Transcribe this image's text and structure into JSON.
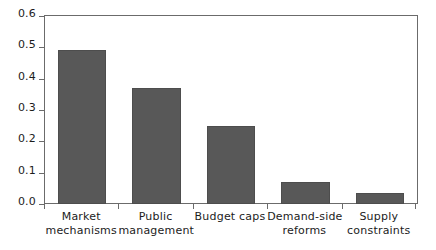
{
  "chart_data": {
    "type": "bar",
    "title": "",
    "subtitle": "",
    "xlabel": "",
    "ylabel": "",
    "categories": [
      "Market mechanisms",
      "Public management",
      "Budget caps",
      "Demand-side reforms",
      "Supply constraints"
    ],
    "category_lines": [
      [
        "Market",
        "mechanisms"
      ],
      [
        "Public",
        "management"
      ],
      [
        "Budget caps",
        ""
      ],
      [
        "Demand-side",
        "reforms"
      ],
      [
        "Supply",
        "constraints"
      ]
    ],
    "values": [
      0.49,
      0.37,
      0.25,
      0.07,
      0.035
    ],
    "ylim": [
      0.0,
      0.6
    ],
    "ytick_labels": [
      "0.0",
      "0.1",
      "0.2",
      "0.3",
      "0.4",
      "0.5",
      "0.6"
    ],
    "ytick_values": [
      0.0,
      0.1,
      0.2,
      0.3,
      0.4,
      0.5,
      0.6
    ],
    "grid": false,
    "legend": null,
    "legend_position": "none",
    "bar_color": "#585858",
    "bar_edge_color": "#4d4d4d",
    "axis_color": "#6b6b6b",
    "text_color": "#1c1c1c",
    "background_color": "#ffffff"
  }
}
